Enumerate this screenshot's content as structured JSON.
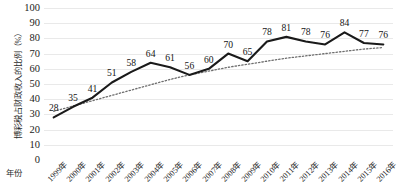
{
  "chart_data": {
    "type": "line",
    "title": "",
    "xlabel": "年份",
    "ylabel": "博彩税占财政收入的比例（%）",
    "ylim": [
      0,
      100
    ],
    "ytick_step": 10,
    "yticks": [
      "100",
      "90",
      "80",
      "70",
      "60",
      "50",
      "40",
      "30",
      "20",
      "10",
      "0"
    ],
    "ytick_values": [
      100,
      90,
      80,
      70,
      60,
      50,
      40,
      30,
      20,
      10,
      0
    ],
    "grid": true,
    "legend": "none",
    "categories": [
      "1999年",
      "2000年",
      "2001年",
      "2002年",
      "2003年",
      "2004年",
      "2005年",
      "2006年",
      "2007年",
      "2008年",
      "2009年",
      "2010年",
      "2011年",
      "2012年",
      "2013年",
      "2014年",
      "2015年",
      "2016年"
    ],
    "x": [
      1999,
      2000,
      2001,
      2002,
      2003,
      2004,
      2005,
      2006,
      2007,
      2008,
      2009,
      2010,
      2011,
      2012,
      2013,
      2014,
      2015,
      2016
    ],
    "series": [
      {
        "name": "博彩税占财政收入的比例",
        "style": "solid",
        "color": "#1a1a1a",
        "values": [
          28,
          35,
          41,
          51,
          58,
          64,
          61,
          56,
          60,
          70,
          65,
          78,
          81,
          78,
          76,
          84,
          77,
          76
        ],
        "data_labels": [
          "28",
          "35",
          "41",
          "51",
          "58",
          "64",
          "61",
          "56",
          "60",
          "70",
          "65",
          "78",
          "81",
          "78",
          "76",
          "84",
          "77",
          "76"
        ]
      },
      {
        "name": "趋势线",
        "style": "dotted",
        "color": "#6e6e6e",
        "values": [
          32,
          35.5,
          39,
          42.5,
          46,
          49.5,
          53,
          56,
          58.5,
          61,
          63,
          65,
          67,
          68.5,
          70,
          71.5,
          73,
          74
        ]
      }
    ]
  }
}
